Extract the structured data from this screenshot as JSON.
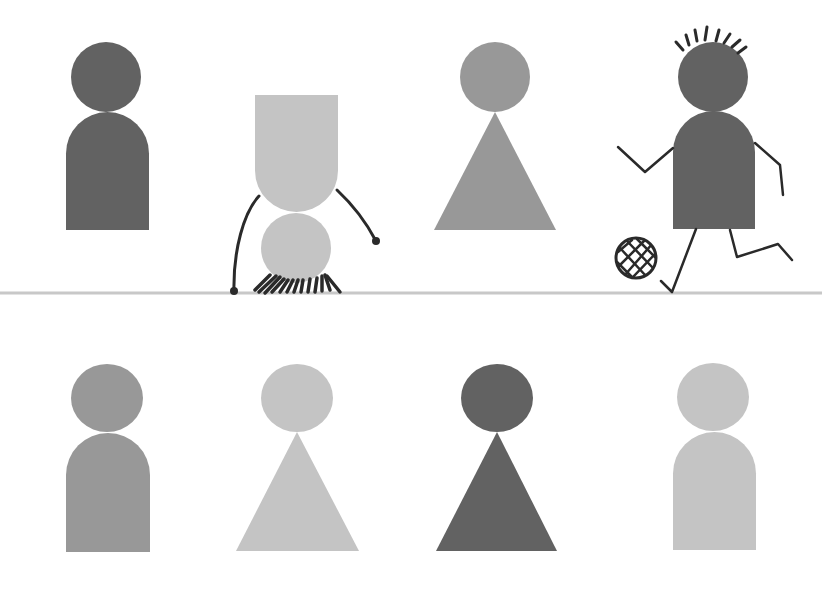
{
  "canvas": {
    "width": 822,
    "height": 589,
    "background": "#ffffff"
  },
  "colors": {
    "dark": "#626262",
    "medium": "#989898",
    "light": "#c4c4c4",
    "ink": "#2a2a2a",
    "ground": "#c8c8c8"
  },
  "ground_line": {
    "y": 293,
    "x1": 0,
    "x2": 822,
    "width": 3
  },
  "top_row": [
    {
      "name": "figure-standing-rounded-dark",
      "shape": "rounded-body",
      "color": "dark",
      "head": {
        "cx": 106,
        "cy": 77,
        "rx": 35,
        "ry": 35
      },
      "body": {
        "x": 66,
        "y": 112,
        "w": 83,
        "h": 118
      }
    },
    {
      "name": "figure-handstand-light",
      "shape": "inverted-rounded-body",
      "color": "light",
      "body": {
        "x": 255,
        "y": 95,
        "w": 83,
        "h": 117
      },
      "head": {
        "cx": 296,
        "cy": 248,
        "rx": 35,
        "ry": 35
      }
    },
    {
      "name": "figure-standing-triangle-medium",
      "shape": "triangle-body",
      "color": "medium",
      "head": {
        "cx": 495,
        "cy": 77,
        "rx": 35,
        "ry": 35
      },
      "body": {
        "apex_x": 495,
        "apex_y": 112,
        "left_x": 434,
        "right_x": 556,
        "base_y": 230
      }
    },
    {
      "name": "figure-kicking-ball-dark",
      "shape": "rounded-body",
      "color": "dark",
      "head": {
        "cx": 713,
        "cy": 77,
        "rx": 35,
        "ry": 35
      },
      "body": {
        "x": 673,
        "y": 111,
        "w": 82,
        "h": 118
      }
    }
  ],
  "bottom_row": [
    {
      "name": "figure-rounded-medium",
      "shape": "rounded-body",
      "color": "medium",
      "head": {
        "cx": 107,
        "cy": 398,
        "rx": 36,
        "ry": 34
      },
      "body": {
        "x": 66,
        "y": 433,
        "w": 84,
        "h": 119
      }
    },
    {
      "name": "figure-triangle-light",
      "shape": "triangle-body",
      "color": "light",
      "head": {
        "cx": 297,
        "cy": 398,
        "rx": 36,
        "ry": 34
      },
      "body": {
        "apex_x": 297,
        "apex_y": 432,
        "left_x": 236,
        "right_x": 359,
        "base_y": 551
      }
    },
    {
      "name": "figure-triangle-dark",
      "shape": "triangle-body",
      "color": "dark",
      "head": {
        "cx": 497,
        "cy": 398,
        "rx": 36,
        "ry": 34
      },
      "body": {
        "apex_x": 497,
        "apex_y": 432,
        "left_x": 436,
        "right_x": 557,
        "base_y": 551
      }
    },
    {
      "name": "figure-rounded-light",
      "shape": "rounded-body",
      "color": "light",
      "head": {
        "cx": 713,
        "cy": 397,
        "rx": 36,
        "ry": 34
      },
      "body": {
        "x": 673,
        "y": 432,
        "w": 83,
        "h": 118
      }
    }
  ],
  "handstand_details": {
    "arms": [
      "M259 196 C 244 212, 233 250, 234 292",
      "M337 190 C 352 204, 366 222, 376 241"
    ],
    "hands": [
      {
        "cx": 234,
        "cy": 291,
        "r": 4
      },
      {
        "cx": 376,
        "cy": 241,
        "r": 4
      }
    ],
    "hair": [
      "M255 290 L 270 275",
      "M259 292 L 276 276",
      "M265 293 L 280 277",
      "M272 292 L 284 279",
      "M280 292 L 288 280",
      "M287 292 L 293 280",
      "M294 292 L 298 280",
      "M301 292 L 303 280",
      "M308 292 L 310 279",
      "M315 292 L 317 278",
      "M322 291 L 322 276",
      "M330 290 L 325 275",
      "M340 292 L 327 276"
    ]
  },
  "kicker_details": {
    "hair": [
      "M683 50 L 676 42",
      "M689 45 L 686 35",
      "M697 41 L 695 30",
      "M705 40 L 707 27",
      "M716 41 L 719 30",
      "M724 43 L 730 34",
      "M732 47 L 740 40",
      "M738 53 L 746 47"
    ],
    "arms": [
      "M673 148 L 645 172 L 618 147",
      "M755 143 L 780 165 L 783 195"
    ],
    "legs": [
      "M696 229 L 672 292 L 661 281",
      "M730 230 L 737 257 L 778 244 L 792 260"
    ],
    "ball": {
      "cx": 636,
      "cy": 258,
      "rx": 20,
      "ry": 20
    },
    "ball_lines": [
      "M620 248 L 646 276",
      "M627 241 L 653 268",
      "M637 239 L 656 258",
      "M617 262 L 632 277",
      "M624 276 L 653 243",
      "M619 266 L 645 240",
      "M632 278 L 656 253",
      "M618 252 L 632 240"
    ]
  }
}
